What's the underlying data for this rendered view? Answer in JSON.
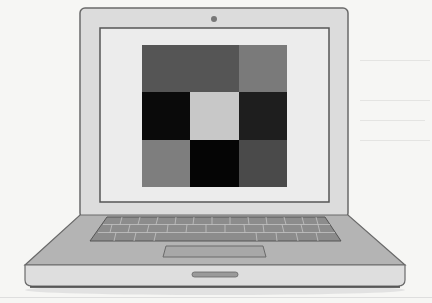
{
  "illustration": {
    "subject": "laptop",
    "screen_content": "3x3 grayscale grid"
  },
  "grid": {
    "rows": 3,
    "cols": 3,
    "cells": [
      [
        "#555555",
        "#555555",
        "#7a7a7a"
      ],
      [
        "#0a0a0a",
        "#c8c8c8",
        "#1e1e1e"
      ],
      [
        "#7e7e7e",
        "#050505",
        "#4a4a4a"
      ]
    ]
  },
  "colors": {
    "page_background": "#f6f6f4",
    "laptop_body": "#dcdcdc",
    "laptop_outline": "#6a6a6a",
    "screen": "#ececec",
    "deck": "#b4b4b4",
    "keyboard": "#8c8c8c",
    "key": "#9e9e9e"
  }
}
